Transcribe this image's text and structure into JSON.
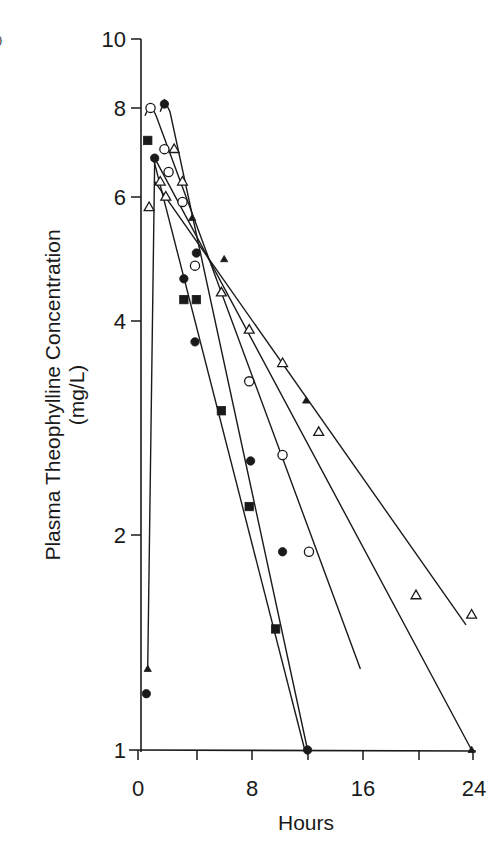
{
  "chart_data": {
    "type": "line",
    "title": "",
    "xlabel": "Hours",
    "ylabel": "Plasma Theophylline Concentration",
    "ylabel_units": "(mg/L)",
    "xscale": "linear",
    "yscale": "log",
    "xlim": [
      0,
      24
    ],
    "ylim": [
      1,
      10
    ],
    "x_ticks": [
      0,
      8,
      16,
      24
    ],
    "x_minor_ticks": [
      4,
      12,
      20
    ],
    "y_ticks": [
      1,
      2,
      4,
      6,
      8,
      10
    ],
    "grid": false,
    "legend": null,
    "series": [
      {
        "name": "Subject A (open circle)",
        "marker": "open-circle",
        "points": [
          [
            0.9,
            8.0
          ],
          [
            1.9,
            7.0
          ],
          [
            2.2,
            6.5
          ],
          [
            3.2,
            5.9
          ],
          [
            4.1,
            4.8
          ],
          [
            8.0,
            3.3
          ],
          [
            10.4,
            2.6
          ],
          [
            12.3,
            1.9
          ]
        ],
        "fit_line": [
          [
            0.5,
            7.8
          ],
          [
            0.9,
            8.1
          ],
          [
            1.3,
            7.8
          ],
          [
            16.0,
            1.3
          ]
        ]
      },
      {
        "name": "Subject B (filled circle)",
        "marker": "filled-circle",
        "points": [
          [
            0.6,
            1.2
          ],
          [
            1.2,
            6.8
          ],
          [
            1.9,
            8.1
          ],
          [
            3.3,
            4.6
          ],
          [
            4.2,
            5.0
          ],
          [
            4.1,
            3.75
          ],
          [
            8.1,
            2.55
          ],
          [
            10.4,
            1.9
          ],
          [
            12.2,
            1.0
          ]
        ],
        "fit_line": [
          [
            1.6,
            7.9
          ],
          [
            1.9,
            8.2
          ],
          [
            2.3,
            7.9
          ],
          [
            12.2,
            1.0
          ]
        ]
      },
      {
        "name": "Subject C (filled square)",
        "marker": "filled-square",
        "points": [
          [
            0.7,
            7.2
          ],
          [
            3.3,
            4.3
          ],
          [
            4.2,
            4.3
          ],
          [
            6.0,
            3.0
          ],
          [
            8.0,
            2.2
          ],
          [
            9.9,
            1.48
          ]
        ],
        "fit_line": [
          [
            1.1,
            6.8
          ],
          [
            12.0,
            1.0
          ]
        ]
      },
      {
        "name": "Subject D (open triangle)",
        "marker": "open-triangle",
        "points": [
          [
            0.8,
            5.8
          ],
          [
            1.6,
            6.3
          ],
          [
            2.0,
            6.0
          ],
          [
            2.6,
            7.0
          ],
          [
            3.2,
            6.3
          ],
          [
            6.0,
            4.4
          ],
          [
            8.0,
            3.9
          ],
          [
            10.4,
            3.5
          ],
          [
            13.0,
            2.8
          ],
          [
            20.0,
            1.65
          ],
          [
            24.0,
            1.55
          ]
        ],
        "fit_line": [
          [
            1.2,
            6.3
          ],
          [
            23.6,
            1.5
          ]
        ]
      },
      {
        "name": "Subject E (filled triangle)",
        "marker": "filled-triangle",
        "points": [
          [
            0.7,
            1.3
          ],
          [
            1.2,
            6.8
          ],
          [
            3.9,
            5.6
          ],
          [
            6.2,
            4.9
          ],
          [
            12.1,
            3.1
          ],
          [
            24.0,
            1.0
          ]
        ],
        "fit_line": [
          [
            0.7,
            1.3
          ],
          [
            1.2,
            6.8
          ],
          [
            24.0,
            1.0
          ]
        ]
      }
    ]
  },
  "axes": {
    "x_label": "Hours",
    "y_label_line1": "Plasma Theophylline Concentration",
    "y_label_line2": "(mg/L)",
    "x_tick_labels": [
      "0",
      "8",
      "16",
      "24"
    ],
    "y_tick_labels": [
      "1",
      "2",
      "4",
      "6",
      "8",
      "10"
    ]
  },
  "colors": {
    "ink": "#1a1a1a",
    "background": "#ffffff"
  }
}
